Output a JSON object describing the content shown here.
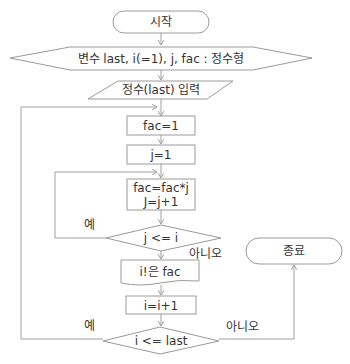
{
  "diagram": {
    "type": "flowchart",
    "colors": {
      "background": "#ffffff",
      "stroke": "#9a9a9a",
      "text": "#333333"
    },
    "nodes": {
      "start": {
        "shape": "terminal",
        "label": "시작"
      },
      "declare": {
        "shape": "preparation",
        "label": "변수 last, i(=1), j, fac : 정수형"
      },
      "input": {
        "shape": "input",
        "label": "정수(last) 입력"
      },
      "fac_init": {
        "shape": "process",
        "label": "fac=1"
      },
      "j_init": {
        "shape": "process",
        "label": "j=1"
      },
      "fac_mult_line1": {
        "shape": "process",
        "label": "fac=fac*j"
      },
      "fac_mult_line2": {
        "shape": "process",
        "label": "J=j+1"
      },
      "cond_j": {
        "shape": "decision",
        "label": "j <= i"
      },
      "output": {
        "shape": "document",
        "label": "i!은 fac"
      },
      "i_inc": {
        "shape": "process",
        "label": "i=i+1"
      },
      "cond_i": {
        "shape": "decision",
        "label": "i <= last"
      },
      "end": {
        "shape": "terminal",
        "label": "종료"
      }
    },
    "branch_labels": {
      "cond_j_yes": "예",
      "cond_j_no": "아니오",
      "cond_i_yes": "예",
      "cond_i_no": "아니오"
    },
    "edges": [
      {
        "from": "start",
        "to": "declare"
      },
      {
        "from": "declare",
        "to": "input"
      },
      {
        "from": "input",
        "to": "fac_init"
      },
      {
        "from": "fac_init",
        "to": "j_init"
      },
      {
        "from": "j_init",
        "to": "fac_mult"
      },
      {
        "from": "fac_mult",
        "to": "cond_j"
      },
      {
        "from": "cond_j",
        "to": "fac_mult",
        "label": "예"
      },
      {
        "from": "cond_j",
        "to": "output",
        "label": "아니오"
      },
      {
        "from": "output",
        "to": "i_inc"
      },
      {
        "from": "i_inc",
        "to": "cond_i"
      },
      {
        "from": "cond_i",
        "to": "fac_init",
        "label": "예"
      },
      {
        "from": "cond_i",
        "to": "end",
        "label": "아니오"
      }
    ]
  }
}
